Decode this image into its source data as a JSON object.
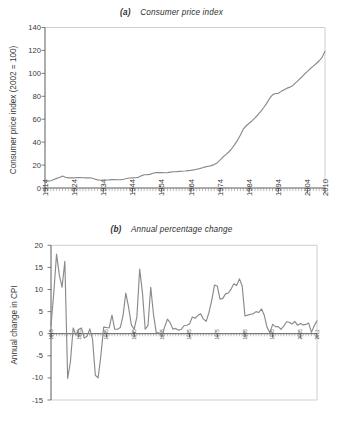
{
  "figure": {
    "background_color": "#ffffff",
    "line_color": "#8a8a8a",
    "axis_color": "#4a4a4a",
    "frame_color": "#c9c9c9"
  },
  "panel_a": {
    "tag": "(a)",
    "title": "Consumer price index",
    "ylabel": "Consumer price index (2002 = 100)",
    "yticks": [
      "0",
      "20",
      "40",
      "60",
      "80",
      "100",
      "120",
      "140"
    ],
    "xticks": [
      "1914",
      "1924",
      "1934",
      "1944",
      "1954",
      "1964",
      "1974",
      "1984",
      "1994",
      "2004",
      "2010"
    ]
  },
  "panel_b": {
    "tag": "(b)",
    "title": "Annual percentage change",
    "ylabel": "Annual change in CPI",
    "yticks": [
      "20",
      "15",
      "10",
      "5",
      "0",
      "-5",
      "-10",
      "-15"
    ],
    "xticks": [
      "1915",
      "1925",
      "1935",
      "1945",
      "1955",
      "1965",
      "1975",
      "1985",
      "1995",
      "2005",
      "2011"
    ]
  },
  "chart_data": [
    {
      "type": "line",
      "title": "(a) Consumer price index",
      "xlabel": "",
      "ylabel": "Consumer price index (2002 = 100)",
      "xlim": [
        1914,
        2010
      ],
      "ylim": [
        0,
        140
      ],
      "grid": false,
      "legend": "none",
      "x": [
        1914,
        1915,
        1916,
        1917,
        1918,
        1919,
        1920,
        1921,
        1922,
        1923,
        1924,
        1925,
        1926,
        1927,
        1928,
        1929,
        1930,
        1931,
        1932,
        1933,
        1934,
        1935,
        1936,
        1937,
        1938,
        1939,
        1940,
        1941,
        1942,
        1943,
        1944,
        1945,
        1946,
        1947,
        1948,
        1949,
        1950,
        1951,
        1952,
        1953,
        1954,
        1955,
        1956,
        1957,
        1958,
        1959,
        1960,
        1961,
        1962,
        1963,
        1964,
        1965,
        1966,
        1967,
        1968,
        1969,
        1970,
        1971,
        1972,
        1973,
        1974,
        1975,
        1976,
        1977,
        1978,
        1979,
        1980,
        1981,
        1982,
        1983,
        1984,
        1985,
        1986,
        1987,
        1988,
        1989,
        1990,
        1991,
        1992,
        1993,
        1994,
        1995,
        1996,
        1997,
        1998,
        1999,
        2000,
        2001,
        2002,
        2003,
        2004,
        2005,
        2006,
        2007,
        2008,
        2009,
        2010
      ],
      "values": [
        5.9,
        6.0,
        6.3,
        7.4,
        8.4,
        9.1,
        10.5,
        9.4,
        8.8,
        8.9,
        8.9,
        9.0,
        9.1,
        8.9,
        8.8,
        8.9,
        8.7,
        7.9,
        7.1,
        6.8,
        6.9,
        7.0,
        7.1,
        7.3,
        7.3,
        7.2,
        7.3,
        7.6,
        8.3,
        8.7,
        8.8,
        8.9,
        9.3,
        10.6,
        11.6,
        11.7,
        11.9,
        12.9,
        13.4,
        13.4,
        13.4,
        13.3,
        13.4,
        13.8,
        14.2,
        14.3,
        14.5,
        14.6,
        14.8,
        15.1,
        15.4,
        15.8,
        16.4,
        16.9,
        17.6,
        18.4,
        19.0,
        19.5,
        20.4,
        21.9,
        24.3,
        27.0,
        29.1,
        31.4,
        34.2,
        37.8,
        41.6,
        46.3,
        51.4,
        54.3,
        56.5,
        58.7,
        61.2,
        63.9,
        66.8,
        70.2,
        73.8,
        78.1,
        81.3,
        82.4,
        82.6,
        84.3,
        85.7,
        87.1,
        88.0,
        89.5,
        91.9,
        94.3,
        96.8,
        99.4,
        101.7,
        104.2,
        106.3,
        108.6,
        111.0,
        114.0,
        119.2
      ]
    },
    {
      "type": "line",
      "title": "(b) Annual percentage change",
      "xlabel": "",
      "ylabel": "Annual change in CPI",
      "xlim": [
        1915,
        2011
      ],
      "ylim": [
        -15,
        20
      ],
      "grid": false,
      "legend": "none",
      "x": [
        1915,
        1916,
        1917,
        1918,
        1919,
        1920,
        1921,
        1922,
        1923,
        1924,
        1925,
        1926,
        1927,
        1928,
        1929,
        1930,
        1931,
        1932,
        1933,
        1934,
        1935,
        1936,
        1937,
        1938,
        1939,
        1940,
        1941,
        1942,
        1943,
        1944,
        1945,
        1946,
        1947,
        1948,
        1949,
        1950,
        1951,
        1952,
        1953,
        1954,
        1955,
        1956,
        1957,
        1958,
        1959,
        1960,
        1961,
        1962,
        1963,
        1964,
        1965,
        1966,
        1967,
        1968,
        1969,
        1970,
        1971,
        1972,
        1973,
        1974,
        1975,
        1976,
        1977,
        1978,
        1979,
        1980,
        1981,
        1982,
        1983,
        1984,
        1985,
        1986,
        1987,
        1988,
        1989,
        1990,
        1991,
        1992,
        1993,
        1994,
        1995,
        1996,
        1997,
        1998,
        1999,
        2000,
        2001,
        2002,
        2003,
        2004,
        2005,
        2006,
        2007,
        2008,
        2009,
        2010,
        2011
      ],
      "values": [
        1.8,
        9.2,
        18.0,
        13.3,
        10.5,
        16.4,
        -10.1,
        -6.4,
        1.3,
        -0.3,
        1.0,
        1.3,
        -1.0,
        -0.6,
        1.1,
        -1.3,
        -9.4,
        -10.0,
        -5.0,
        1.5,
        1.4,
        1.3,
        4.2,
        1.0,
        1.0,
        1.4,
        4.1,
        9.2,
        6.0,
        2.0,
        1.0,
        3.8,
        14.6,
        9.3,
        1.0,
        1.9,
        10.5,
        4.3,
        0.2,
        0.2,
        -0.4,
        1.5,
        3.3,
        2.5,
        1.0,
        1.2,
        0.8,
        1.0,
        1.8,
        1.9,
        2.2,
        3.8,
        3.5,
        4.1,
        4.5,
        3.3,
        2.8,
        4.8,
        7.5,
        11.0,
        10.8,
        7.8,
        8.0,
        9.0,
        9.2,
        10.1,
        11.3,
        10.9,
        12.4,
        10.8,
        4.0,
        4.2,
        4.4,
        4.5,
        5.0,
        4.8,
        5.6,
        4.1,
        1.4,
        0.2,
        2.1,
        1.6,
        1.6,
        1.0,
        1.7,
        2.7,
        2.6,
        2.2,
        2.8,
        1.9,
        2.3,
        2.0,
        2.1,
        2.4,
        0.3,
        1.8,
        2.9
      ]
    }
  ]
}
